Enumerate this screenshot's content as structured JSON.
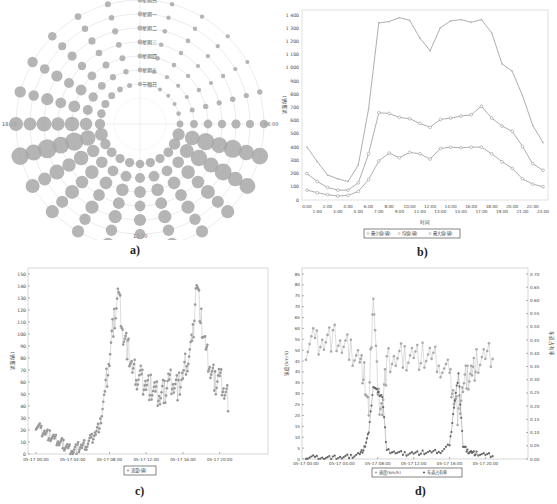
{
  "captions": {
    "a": "a)",
    "b": "b)",
    "c": "c)",
    "d": "d)"
  },
  "chart_data": [
    {
      "id": "a",
      "type": "scatter",
      "subtype": "polar-bubble",
      "title": "",
      "angular_ticks": [
        "00:00",
        "06:00",
        "12:00",
        "18:00"
      ],
      "rings": [
        "星期日",
        "星期一",
        "星期二",
        "星期三",
        "星期四",
        "星期五",
        "节假日"
      ],
      "note": "Bubble size represents traffic flow per hour per day type; larger bubbles cluster around 07:00-09:00 and 16:00-18:00",
      "hours": [
        0,
        1,
        2,
        3,
        4,
        5,
        6,
        7,
        8,
        9,
        10,
        11,
        12,
        13,
        14,
        15,
        16,
        17,
        18,
        19,
        20,
        21,
        22,
        23
      ],
      "relative_size": [
        0.1,
        0.08,
        0.07,
        0.06,
        0.06,
        0.12,
        0.3,
        0.75,
        0.7,
        0.55,
        0.5,
        0.5,
        0.45,
        0.5,
        0.5,
        0.55,
        0.6,
        0.8,
        0.6,
        0.45,
        0.4,
        0.3,
        0.2,
        0.15
      ]
    },
    {
      "id": "b",
      "type": "line",
      "title": "",
      "xlabel": "时间",
      "ylabel": "流量(辆)",
      "ylim": [
        0,
        1400
      ],
      "yticks": [
        "0",
        "100",
        "200",
        "300",
        "400",
        "500",
        "600",
        "700",
        "800",
        "900",
        "1 000",
        "1 100",
        "1 200",
        "1 300",
        "1 400"
      ],
      "categories": [
        "0:00",
        "1:00",
        "2:00",
        "3:00",
        "4:00",
        "5:00",
        "6:00",
        "7:00",
        "8:00",
        "9:00",
        "10:00",
        "11:00",
        "12:00",
        "13:00",
        "14:00",
        "15:00",
        "16:00",
        "17:00",
        "18:00",
        "19:00",
        "20:00",
        "21:00",
        "22:00",
        "23:00"
      ],
      "series": [
        {
          "name": "最小值(辆)",
          "values": [
            75,
            55,
            40,
            30,
            35,
            65,
            155,
            295,
            355,
            320,
            360,
            350,
            310,
            390,
            400,
            395,
            400,
            400,
            350,
            290,
            240,
            160,
            120,
            100
          ]
        },
        {
          "name": "均值(辆)",
          "values": [
            200,
            140,
            95,
            75,
            75,
            130,
            350,
            660,
            655,
            625,
            615,
            580,
            550,
            610,
            620,
            635,
            645,
            710,
            620,
            560,
            520,
            405,
            275,
            225
          ]
        },
        {
          "name": "最大值(辆)",
          "values": [
            400,
            290,
            190,
            160,
            140,
            265,
            690,
            1340,
            1350,
            1380,
            1360,
            1225,
            1130,
            1305,
            1355,
            1365,
            1345,
            1365,
            1265,
            1030,
            975,
            790,
            565,
            435
          ]
        }
      ],
      "legend": [
        "最小值(辆)",
        "均值(辆)",
        "最大值(辆)"
      ],
      "legend_position": "bottom"
    },
    {
      "id": "c",
      "type": "line",
      "title": "",
      "xlabel": "",
      "ylabel": "流量(辆)",
      "ylim": [
        0,
        150
      ],
      "yticks": [
        "0",
        "10",
        "20",
        "30",
        "40",
        "50",
        "60",
        "70",
        "80",
        "90",
        "100",
        "110",
        "120",
        "130",
        "140",
        "150"
      ],
      "xticks": [
        "05-17 00:00",
        "05-17 04:00",
        "05-17 08:00",
        "05-17 12:00",
        "05-17 16:00",
        "05-17 20:00"
      ],
      "legend": [
        "流量(辆)"
      ],
      "x_hours": [
        0,
        0.5,
        1,
        1.5,
        2,
        2.5,
        3,
        3.5,
        4,
        4.5,
        5,
        5.5,
        6,
        6.5,
        7,
        7.5,
        8,
        8.5,
        9,
        9.5,
        10,
        10.5,
        11,
        11.5,
        12,
        12.5,
        13,
        13.5,
        14,
        14.5,
        15,
        15.5,
        16,
        16.5,
        17,
        17.5,
        18,
        18.5,
        19,
        19.5,
        20,
        20.5,
        21
      ],
      "values": [
        25,
        20,
        18,
        15,
        12,
        10,
        8,
        5,
        3,
        5,
        6,
        8,
        12,
        18,
        25,
        50,
        80,
        112,
        135,
        100,
        88,
        70,
        65,
        62,
        58,
        55,
        50,
        48,
        52,
        62,
        60,
        55,
        65,
        80,
        90,
        145,
        110,
        85,
        70,
        60,
        65,
        55,
        45
      ]
    },
    {
      "id": "d",
      "type": "line",
      "title": "",
      "xlabel": "",
      "ylabel": "速度(km/h)",
      "ylabel_right": "车道占有率",
      "ylim": [
        0,
        85
      ],
      "ylim_right": [
        0,
        0.7
      ],
      "yticks": [
        "0",
        "5",
        "10",
        "15",
        "20",
        "25",
        "30",
        "35",
        "40",
        "45",
        "50",
        "55",
        "60",
        "65",
        "70",
        "75",
        "80",
        "85"
      ],
      "yticks_right": [
        "0.00",
        "0.05",
        "0.10",
        "0.15",
        "0.20",
        "0.25",
        "0.30",
        "0.35",
        "0.40",
        "0.45",
        "0.50",
        "0.55",
        "0.60",
        "0.65",
        "0.70"
      ],
      "xticks": [
        "05-17 00:00",
        "05-17 04:00",
        "05-17 08:00",
        "05-17 12:00",
        "05-17 16:00",
        "05-17 20:00"
      ],
      "legend": [
        "速度(km/h)",
        "车道占有率"
      ],
      "x_hours": [
        0,
        1,
        2,
        3,
        4,
        5,
        6,
        6.5,
        7,
        7.5,
        8,
        8.5,
        9,
        10,
        11,
        12,
        13,
        14,
        15,
        16,
        16.5,
        17,
        17.5,
        18,
        18.5,
        19,
        20,
        21
      ],
      "series": [
        {
          "name": "速度(km/h)",
          "values": [
            52,
            54,
            55,
            56,
            52,
            50,
            46,
            38,
            20,
            80,
            28,
            25,
            44,
            46,
            47,
            48,
            47,
            46,
            44,
            38,
            30,
            20,
            34,
            38,
            40,
            44,
            46,
            48
          ]
        },
        {
          "name": "车道占有率",
          "values": [
            0.005,
            0.006,
            0.005,
            0.005,
            0.006,
            0.01,
            0.02,
            0.04,
            0.1,
            0.28,
            0.25,
            0.24,
            0.03,
            0.025,
            0.02,
            0.022,
            0.024,
            0.025,
            0.03,
            0.05,
            0.2,
            0.32,
            0.05,
            0.03,
            0.025,
            0.02,
            0.015,
            0.012
          ]
        }
      ]
    }
  ]
}
